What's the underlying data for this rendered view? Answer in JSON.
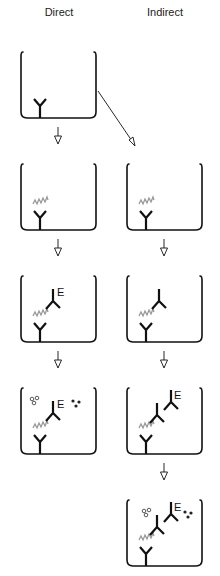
{
  "columns": {
    "direct": {
      "title": "Direct"
    },
    "indirect": {
      "title": "Indirect"
    }
  },
  "labels": {
    "enzyme": "E"
  },
  "colors": {
    "stroke": "#111111",
    "antigen": "#999999",
    "background": "#ffffff"
  },
  "steps": {
    "direct": [
      {
        "step": 1,
        "contents": [
          "capture-antibody"
        ]
      },
      {
        "step": 2,
        "contents": [
          "capture-antibody",
          "antigen"
        ]
      },
      {
        "step": 3,
        "contents": [
          "capture-antibody",
          "antigen",
          "enzyme-labeled-detection-antibody"
        ]
      },
      {
        "step": 4,
        "contents": [
          "capture-antibody",
          "antigen",
          "enzyme-labeled-detection-antibody",
          "substrate",
          "product"
        ]
      }
    ],
    "indirect": [
      {
        "step": 2,
        "contents": [
          "capture-antibody",
          "antigen"
        ]
      },
      {
        "step": 3,
        "contents": [
          "capture-antibody",
          "antigen",
          "detection-antibody"
        ]
      },
      {
        "step": 4,
        "contents": [
          "capture-antibody",
          "antigen",
          "detection-antibody",
          "enzyme-labeled-secondary-antibody"
        ]
      },
      {
        "step": 5,
        "contents": [
          "capture-antibody",
          "antigen",
          "detection-antibody",
          "enzyme-labeled-secondary-antibody",
          "substrate",
          "product"
        ]
      }
    ]
  }
}
